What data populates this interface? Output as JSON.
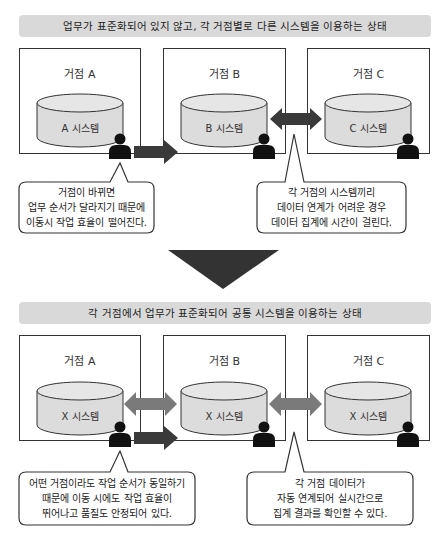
{
  "top_section": {
    "banner": "업무가 표준화되어 있지 않고, 각 거점별로 다른 시스템을 이용하는 상태",
    "sites": [
      {
        "title": "거점 A",
        "system": "A 시스템"
      },
      {
        "title": "거점 B",
        "system": "B 시스템"
      },
      {
        "title": "거점 C",
        "system": "C 시스템"
      }
    ],
    "callouts": [
      {
        "lines": [
          "거점이 바뀌면",
          "업무 순서가 달라지기 때문에",
          "이동시 작업 효율이 떨어진다."
        ]
      },
      {
        "lines": [
          "각 거점의 시스템끼리",
          "데이터 연계가 어려운 경우",
          "데이터 집계에 시간이 걸린다."
        ]
      }
    ]
  },
  "bottom_section": {
    "banner": "각 거점에서 업무가 표준화되어 공통 시스템을 이용하는 상태",
    "sites": [
      {
        "title": "거점 A",
        "system": "X 시스템"
      },
      {
        "title": "거점 B",
        "system": "X 시스템"
      },
      {
        "title": "거점 C",
        "system": "X 시스템"
      }
    ],
    "callouts": [
      {
        "lines": [
          "어떤 거점이라도 작업 순서가 동일하기",
          "때문에 이동 시에도 작업 효율이",
          "뛰어나고 품질도 안정되어 있다."
        ]
      },
      {
        "lines": [
          "각 거점 데이터가",
          "자동 연계되어 실시간으로",
          "집계 결과를 확인할 수 있다."
        ]
      }
    ]
  },
  "colors": {
    "banner_bg": "#d9d9d9",
    "cylinder_fill": "#dcdcdc",
    "arrow_dark": "#3a3a3a",
    "arrow_gray": "#7a7a7a",
    "transition_arrow": "#333333"
  }
}
